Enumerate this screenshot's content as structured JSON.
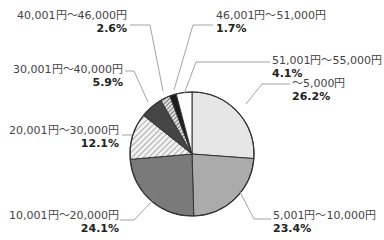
{
  "chart_data": {
    "type": "pie",
    "title": "",
    "start_angle_deg": 0,
    "direction": "clockwise",
    "categories": [
      "～5,000円",
      "5,001円～10,000円",
      "10,001円～20,000円",
      "20,001円～30,000円",
      "30,001円～40,000円",
      "40,001円～46,000円",
      "46,001円～51,000円",
      "51,001円～55,000円"
    ],
    "values": [
      26.2,
      23.4,
      24.1,
      12.1,
      5.9,
      2.6,
      1.7,
      4.1
    ],
    "value_labels": [
      "26.2%",
      "23.4%",
      "24.1%",
      "12.1%",
      "5.9%",
      "2.6%",
      "1.7%",
      "4.1%"
    ],
    "fills": [
      "#e6e6e6",
      "#ababab",
      "#7a7a7a",
      "hatch-light",
      "#454545",
      "hatch-dark",
      "#1c1c1c",
      "#ffffff"
    ],
    "legend": "none (direct labels with leader lines)"
  },
  "slices": [
    {
      "range": "～5,000円",
      "pct": "26.2%",
      "lx": 292,
      "ly": 77,
      "align": "left",
      "line": [
        [
          246,
          104
        ],
        [
          262,
          84
        ],
        [
          290,
          84
        ]
      ]
    },
    {
      "range": "5,001円～10,000円",
      "pct": "23.4%",
      "lx": 273,
      "ly": 209,
      "align": "left",
      "line": [
        [
          239,
          190
        ],
        [
          254,
          219
        ],
        [
          271,
          219
        ]
      ]
    },
    {
      "range": "10,001円～20,000円",
      "pct": "24.1%",
      "lx": 6,
      "ly": 209,
      "align": "right",
      "rw": 113,
      "line": [
        [
          154,
          199
        ],
        [
          134,
          220
        ],
        [
          120,
          220
        ]
      ]
    },
    {
      "range": "20,001円～30,000円",
      "pct": "12.1%",
      "lx": 6,
      "ly": 124,
      "align": "right",
      "rw": 113,
      "line": [
        [
          132,
          135
        ],
        [
          122,
          135
        ]
      ]
    },
    {
      "range": "30,001円～40,000円",
      "pct": "5.9%",
      "lx": 6,
      "ly": 63,
      "align": "right",
      "rw": 117,
      "line": [
        [
          148,
          102
        ],
        [
          134,
          71
        ],
        [
          125,
          71
        ]
      ]
    },
    {
      "range": "40,001円～46,000円",
      "pct": "2.6%",
      "lx": 6,
      "ly": 9,
      "align": "right",
      "rw": 121,
      "line": [
        [
          163,
          91
        ],
        [
          150,
          25
        ],
        [
          130,
          25
        ]
      ]
    },
    {
      "range": "46,001円～51,000円",
      "pct": "1.7%",
      "lx": 216,
      "ly": 9,
      "align": "left",
      "line": [
        [
          174,
          90
        ],
        [
          193,
          25
        ],
        [
          213,
          25
        ]
      ]
    },
    {
      "range": "51,001円～55,000円",
      "pct": "4.1%",
      "lx": 272,
      "ly": 54,
      "align": "left",
      "line": [
        [
          184,
          94
        ],
        [
          196,
          62
        ],
        [
          270,
          62
        ]
      ]
    }
  ],
  "pie": {
    "cx": 192,
    "cy": 154,
    "r": 62
  }
}
